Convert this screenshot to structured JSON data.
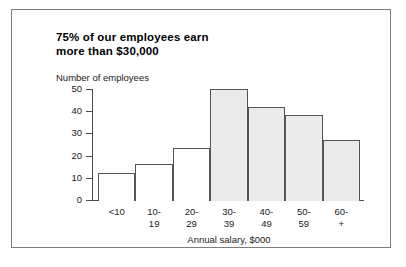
{
  "figure": {
    "title_line1": "75% of our employees earn",
    "title_line2": "more than $30,000",
    "frame_color": "#7d7d7d",
    "background": "#ffffff"
  },
  "chart_data": {
    "type": "bar",
    "title": "75% of our employees earn more than $30,000",
    "xlabel": "Annual salary, $000",
    "ylabel": "Number of employees",
    "categories": [
      "<10",
      "10-19",
      "20-29",
      "30-39",
      "40-49",
      "50-59",
      "60-+"
    ],
    "category_lines": [
      [
        "<10",
        ""
      ],
      [
        "10-",
        "19"
      ],
      [
        "20-",
        "29"
      ],
      [
        "30-",
        "39"
      ],
      [
        "40-",
        "49"
      ],
      [
        "50-",
        "59"
      ],
      [
        "60-",
        "+"
      ]
    ],
    "values": [
      12,
      16,
      23.5,
      50,
      42,
      38.5,
      27
    ],
    "bar_fill": [
      "plain",
      "plain",
      "plain",
      "shaded",
      "shaded",
      "shaded",
      "shaded"
    ],
    "ylim": [
      0,
      50
    ],
    "yticks": [
      0,
      10,
      20,
      30,
      40,
      50
    ],
    "ytick_labels": [
      "0",
      "10",
      "20",
      "30",
      "40",
      "50"
    ],
    "grid": false,
    "legend": null,
    "colors": {
      "shaded_bar": "#ebebeb",
      "plain_bar": "#ffffff",
      "bar_outline": "#555555",
      "axis": "#4a4a4a",
      "text": "#1a1a1a"
    }
  }
}
